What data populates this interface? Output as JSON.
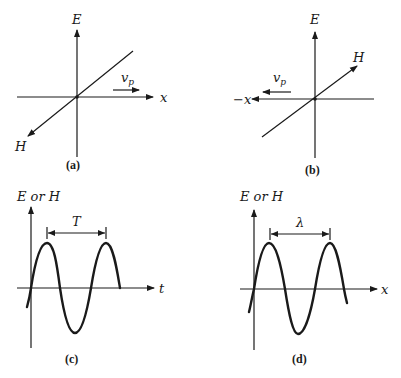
{
  "figure": {
    "panels": [
      {
        "id": "a",
        "caption": "(a)",
        "vertical_axis_label": "E",
        "horizontal_axis_label": "x",
        "oblique_axis_label": "H",
        "velocity_label": "v",
        "velocity_subscript": "p",
        "propagation_direction": "+x"
      },
      {
        "id": "b",
        "caption": "(b)",
        "vertical_axis_label": "E",
        "horizontal_axis_label": "−x",
        "oblique_axis_label": "H",
        "velocity_label": "v",
        "velocity_subscript": "p",
        "propagation_direction": "−x"
      },
      {
        "id": "c",
        "caption": "(c)",
        "vertical_axis_label": "E or H",
        "horizontal_axis_label": "t",
        "dimension_label": "T"
      },
      {
        "id": "d",
        "caption": "(d)",
        "vertical_axis_label": "E or H",
        "horizontal_axis_label": "x",
        "dimension_label": "λ"
      }
    ]
  },
  "colors": {
    "ink": "#1a1a1a",
    "background": "#ffffff"
  }
}
